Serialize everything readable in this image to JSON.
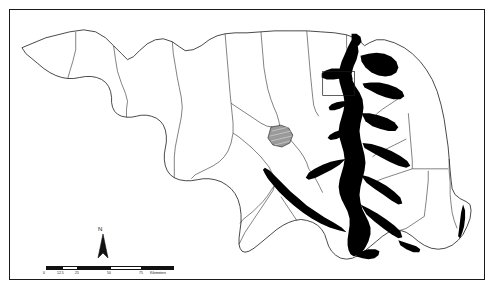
{
  "map": {
    "title": "Maryland state map with Chesapeake Bay",
    "region": "Maryland",
    "frame_color": "#1a1a1a",
    "land_fill": "#ffffff",
    "water_fill": "#000000",
    "boundary_color": "#1a1a1a",
    "highlight_fill": "#9a9a9a",
    "north_arrow": {
      "label": "N",
      "name": "north-arrow"
    },
    "scalebar": {
      "name": "scale-bar",
      "unit_label": "Kilometers",
      "ticks": [
        "0",
        "12.5",
        "25",
        "50",
        "75"
      ],
      "segments": [
        {
          "fill": "#111111"
        },
        {
          "fill": "#ffffff"
        },
        {
          "fill": "#111111"
        },
        {
          "fill": "#ffffff"
        }
      ]
    },
    "features": {
      "highlight_polygon_label": "",
      "inset_box_label": ""
    }
  }
}
